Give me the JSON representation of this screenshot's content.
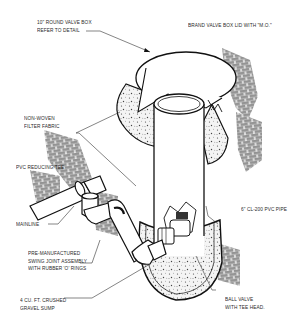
{
  "diagram": {
    "type": "isometric installation detail",
    "colors": {
      "background": "#ffffff",
      "line": "#111111",
      "text": "#2a2a2a",
      "gravel_fill": "#f2f2f2"
    },
    "labels": {
      "valve_box": {
        "line1": "10\" ROUND VALVE BOX",
        "line2": "REFER TO DETAIL"
      },
      "lid": {
        "line1": "BRAND VALVE BOX LID WITH \"M.O.\""
      },
      "filter_fabric": {
        "line1": "NON-WOVEN",
        "line2": "FILTER FABRIC"
      },
      "reducing_tee": {
        "line1": "PVC REDUCING TEE"
      },
      "pvc_pipe": {
        "line1": "6\" CL-200 PVC PIPE"
      },
      "mainline": {
        "line1": "MAINLINE"
      },
      "swing_joint": {
        "line1": "PRE-MANUFACTURED",
        "line2": "SWING JOINT ASSEMBLY",
        "line3": "WITH RUBBER 'O' RINGS"
      },
      "gravel_sump": {
        "line1": "4 CU. FT. CRUSHED",
        "line2": "GRAVEL SUMP"
      },
      "ball_valve": {
        "line1": "BALL VALVE",
        "line2": "WITH TEE HEAD."
      }
    }
  }
}
